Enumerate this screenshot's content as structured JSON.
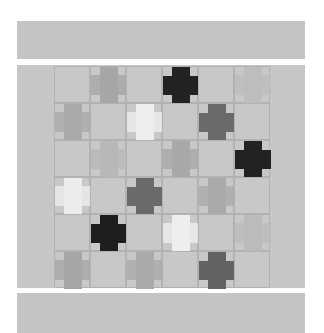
{
  "scene": "quilt photograph",
  "colors": {
    "background": "#ffffff",
    "border_band": "#c4c4c4",
    "quilt_field": "#c6c6c6",
    "grid_line": "#b2b2b2"
  },
  "grid": {
    "cols": 6,
    "rows": 6,
    "origin_x": 37,
    "origin_y": 1,
    "cell_w": 36,
    "cell_h": 37
  },
  "blocks": [
    {
      "row": 0,
      "col": 1,
      "shape": "tall",
      "color": "#a6a6a6"
    },
    {
      "row": 0,
      "col": 3,
      "shape": "cross",
      "color": "#222222"
    },
    {
      "row": 0,
      "col": 5,
      "shape": "tall",
      "color": "#bdbdbd"
    },
    {
      "row": 1,
      "col": 0,
      "shape": "tall",
      "color": "#aaaaaa"
    },
    {
      "row": 1,
      "col": 2,
      "shape": "tall",
      "color": "#eeeeee"
    },
    {
      "row": 1,
      "col": 4,
      "shape": "cross",
      "color": "#6a6a6a"
    },
    {
      "row": 2,
      "col": 1,
      "shape": "tall",
      "color": "#b8b8b8"
    },
    {
      "row": 2,
      "col": 3,
      "shape": "tall",
      "color": "#a8a8a8"
    },
    {
      "row": 2,
      "col": 5,
      "shape": "cross",
      "color": "#222222"
    },
    {
      "row": 3,
      "col": 0,
      "shape": "tall",
      "color": "#ececec"
    },
    {
      "row": 3,
      "col": 2,
      "shape": "cross",
      "color": "#6a6a6a"
    },
    {
      "row": 3,
      "col": 4,
      "shape": "tall",
      "color": "#aaaaaa"
    },
    {
      "row": 4,
      "col": 1,
      "shape": "cross",
      "color": "#1e1e1e"
    },
    {
      "row": 4,
      "col": 3,
      "shape": "tall",
      "color": "#eeeeee"
    },
    {
      "row": 4,
      "col": 5,
      "shape": "tall",
      "color": "#bbbbbb"
    },
    {
      "row": 5,
      "col": 0,
      "shape": "tall",
      "color": "#a6a6a6"
    },
    {
      "row": 5,
      "col": 2,
      "shape": "tall",
      "color": "#aaaaaa"
    },
    {
      "row": 5,
      "col": 4,
      "shape": "cross",
      "color": "#636363"
    }
  ]
}
